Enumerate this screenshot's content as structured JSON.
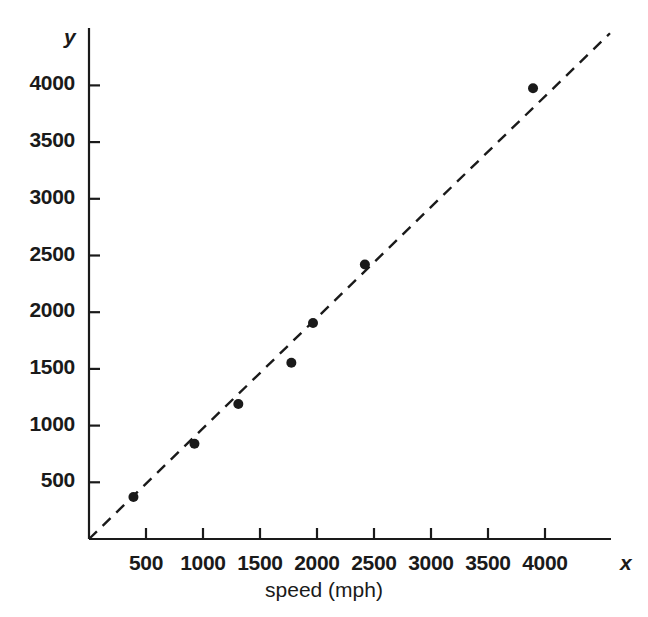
{
  "chart_data": {
    "type": "scatter",
    "title": "",
    "subtitle": "",
    "xlabel": "speed (mph)",
    "ylabel": "",
    "x_axis_name": "x",
    "y_axis_name": "y",
    "xlim": [
      0,
      4400
    ],
    "ylim": [
      0,
      4400
    ],
    "xticks": [
      500,
      1000,
      1500,
      2000,
      2500,
      3000,
      3500,
      4000
    ],
    "yticks": [
      500,
      1000,
      1500,
      2000,
      2500,
      3000,
      3500,
      4000
    ],
    "xtick_labels": [
      "500",
      "1000",
      "1500",
      "2000",
      "2500",
      "3000",
      "3500",
      "4000"
    ],
    "ytick_labels": [
      "500",
      "1000",
      "1500",
      "2000",
      "2500",
      "3000",
      "3500",
      "4000"
    ],
    "grid": false,
    "legend": false,
    "legend_position": "none",
    "marker": "filled-circle",
    "marker_color": "#1a1a1a",
    "marker_size": 10,
    "points": [
      {
        "x": 390,
        "y": 370
      },
      {
        "x": 925,
        "y": 840
      },
      {
        "x": 1310,
        "y": 1190
      },
      {
        "x": 1775,
        "y": 1555
      },
      {
        "x": 1965,
        "y": 1905
      },
      {
        "x": 2420,
        "y": 2420
      },
      {
        "x": 3895,
        "y": 3975
      }
    ],
    "trendline": {
      "style": "dashed",
      "color": "#1a1a1a",
      "x_start": 0,
      "y_start": 0,
      "x_end": 4570,
      "y_end": 4460
    },
    "axis_color": "#1a1a1a"
  },
  "axes": {
    "caption": "speed (mph)",
    "x_symbol": "x",
    "y_symbol": "y"
  }
}
